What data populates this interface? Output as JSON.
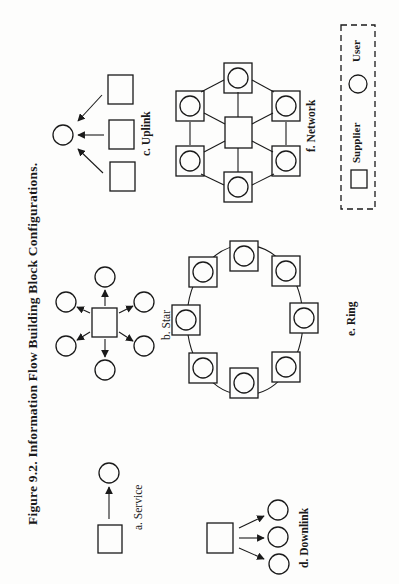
{
  "figure": {
    "title": "Figure 9.2. Information Flow Building Block Configurations.",
    "orientation": "rotated 90° counter-clockwise",
    "panels": [
      {
        "id": "a",
        "label": "a. Service",
        "description": "One supplier sends to one user"
      },
      {
        "id": "b",
        "label": "b. Star",
        "description": "One supplier sends to six users"
      },
      {
        "id": "c",
        "label": "c. Uplink",
        "description": "Three suppliers send to one user"
      },
      {
        "id": "d",
        "label": "d. Downlink",
        "description": "One supplier sends to three users"
      },
      {
        "id": "e",
        "label": "e. Ring",
        "description": "Ten supplier-user nodes connected in a ring"
      },
      {
        "id": "f",
        "label": "f. Network",
        "description": "Six supplier-user nodes connected around a central supplier"
      }
    ],
    "legend": {
      "items": [
        {
          "symbol": "square",
          "label": "Supplier"
        },
        {
          "symbol": "circle",
          "label": "User"
        }
      ]
    }
  }
}
